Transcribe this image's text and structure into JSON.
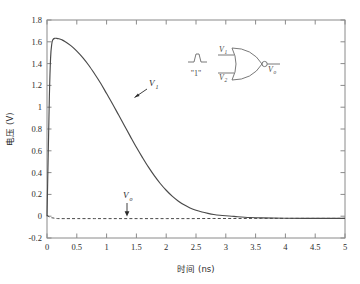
{
  "chart_data": {
    "type": "line",
    "title": "",
    "xlabel": "时间 (ns)",
    "ylabel": "电压 (V)",
    "xlim": [
      0,
      5
    ],
    "ylim": [
      -0.2,
      1.8
    ],
    "xticks": [
      "0",
      "0.5",
      "1",
      "1.5",
      "2",
      "2.5",
      "3",
      "3.5",
      "4",
      "4.5",
      "5"
    ],
    "yticks": [
      "-0.2",
      "0",
      "0.2",
      "0.4",
      "0.6",
      "0.8",
      "1",
      "1.2",
      "1.4",
      "1.6",
      "1.8"
    ],
    "grid": false,
    "legend_position": "inline-annotations",
    "series": [
      {
        "name": "V1",
        "style": "solid",
        "color": "#4a4a4a",
        "x": [
          0.0,
          0.02,
          0.04,
          0.06,
          0.08,
          0.1,
          0.13,
          0.16,
          0.2,
          0.25,
          0.3,
          0.4,
          0.5,
          0.6,
          0.7,
          0.8,
          0.9,
          1.0,
          1.1,
          1.2,
          1.3,
          1.4,
          1.5,
          1.6,
          1.7,
          1.8,
          1.9,
          2.0,
          2.1,
          2.2,
          2.3,
          2.4,
          2.5,
          2.6,
          2.7,
          2.8,
          2.9,
          3.0,
          3.1,
          3.2,
          3.4,
          3.6,
          4.0,
          4.5,
          5.0
        ],
        "y": [
          0.0,
          0.55,
          1.1,
          1.45,
          1.58,
          1.62,
          1.632,
          1.632,
          1.628,
          1.618,
          1.603,
          1.565,
          1.515,
          1.455,
          1.385,
          1.305,
          1.22,
          1.125,
          1.03,
          0.93,
          0.83,
          0.73,
          0.632,
          0.54,
          0.452,
          0.372,
          0.3,
          0.238,
          0.184,
          0.14,
          0.104,
          0.076,
          0.054,
          0.038,
          0.026,
          0.016,
          0.009,
          0.004,
          0.0,
          -0.005,
          -0.012,
          -0.016,
          -0.019,
          -0.02,
          -0.02
        ]
      },
      {
        "name": "V0",
        "style": "dashed",
        "color": "#4a4a4a",
        "x": [
          0.0,
          0.05,
          0.1,
          0.15,
          0.2,
          0.3,
          0.5,
          0.8,
          1.2,
          1.6,
          2.0,
          2.4,
          2.8,
          3.2,
          3.6,
          4.0,
          4.5,
          5.0
        ],
        "y": [
          0.01,
          -0.01,
          -0.016,
          -0.02,
          -0.022,
          -0.022,
          -0.022,
          -0.022,
          -0.022,
          -0.022,
          -0.022,
          -0.022,
          -0.021,
          -0.021,
          -0.02,
          -0.02,
          -0.02,
          -0.02
        ]
      }
    ],
    "annotations": [
      {
        "name": "v1-label",
        "text": "V",
        "sub": "1",
        "x": 1.48,
        "y": 1.02
      },
      {
        "name": "v0-label",
        "text": "V",
        "sub": "o",
        "x": 1.22,
        "y": 0.18
      }
    ]
  },
  "inset": {
    "name": "nor-gate-diagram",
    "input_pulse_label": "\"1\"",
    "gate_type": "NOR",
    "input1": {
      "text": "V",
      "sub": "1"
    },
    "input2": {
      "text": "V",
      "sub": "2"
    },
    "output": {
      "text": "V",
      "sub": "o"
    }
  }
}
